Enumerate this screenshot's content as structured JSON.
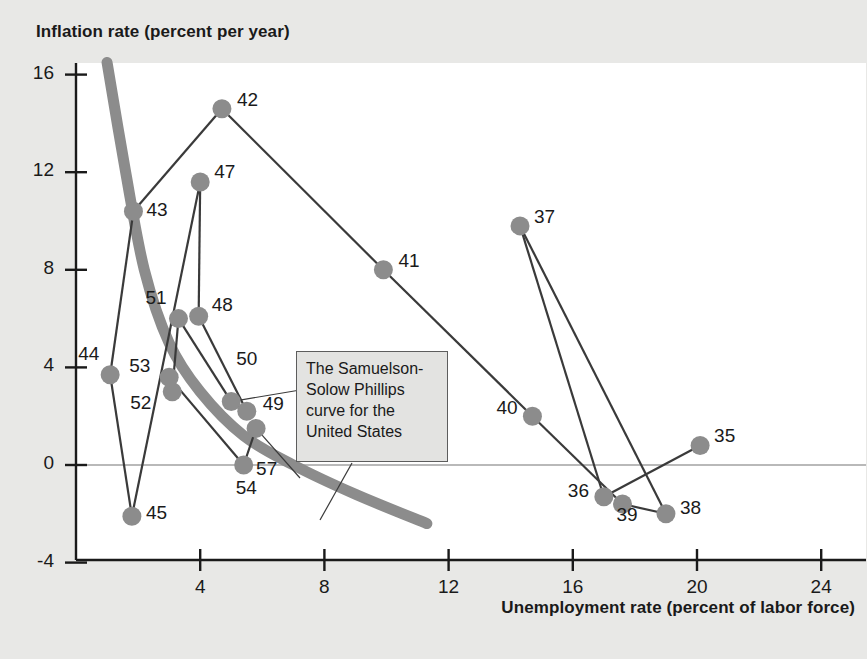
{
  "axes": {
    "y_title": "Inflation rate (percent per year)",
    "x_title": "Unemployment rate (percent of labor force)",
    "y_ticks": [
      "16",
      "12",
      "8",
      "4",
      "0",
      "-4"
    ],
    "x_ticks": [
      "4",
      "8",
      "12",
      "16",
      "20",
      "24"
    ]
  },
  "annotation": {
    "line1": "The Samuelson-",
    "line2": "Solow Phillips",
    "line3": "curve for the",
    "line4": "United States"
  },
  "colors": {
    "marker": "#8c8c8c",
    "curve": "#8c8c8c",
    "connector": "#3a3a3a",
    "plot_bg": "#ffffff",
    "page_bg": "#e8e8e6",
    "text": "#1a1a1a"
  },
  "chart_data": {
    "type": "scatter",
    "title": "",
    "xlabel": "Unemployment rate (percent of labor force)",
    "ylabel": "Inflation rate (percent per year)",
    "xlim": [
      0,
      25.5
    ],
    "ylim": [
      -4,
      17
    ],
    "xticks": [
      4,
      8,
      12,
      16,
      20,
      24
    ],
    "yticks": [
      -4,
      0,
      4,
      8,
      12,
      16
    ],
    "grid": false,
    "legend": null,
    "point_label_note": "Labels are two-digit years (1935-1957)",
    "points": [
      {
        "label": "35",
        "x": 20.1,
        "y": 0.8,
        "lx": 14,
        "ly": -10
      },
      {
        "label": "36",
        "x": 17.0,
        "y": -1.3,
        "lx": -36,
        "ly": -7
      },
      {
        "label": "37",
        "x": 14.3,
        "y": 9.8,
        "lx": 14,
        "ly": -10
      },
      {
        "label": "38",
        "x": 19.0,
        "y": -2.0,
        "lx": 14,
        "ly": -7
      },
      {
        "label": "39",
        "x": 17.6,
        "y": -1.6,
        "lx": -6,
        "ly": 10
      },
      {
        "label": "40",
        "x": 14.7,
        "y": 2.0,
        "lx": -36,
        "ly": -9
      },
      {
        "label": "41",
        "x": 9.9,
        "y": 8.0,
        "lx": 15,
        "ly": -10
      },
      {
        "label": "42",
        "x": 4.7,
        "y": 14.6,
        "lx": 15,
        "ly": -10
      },
      {
        "label": "43",
        "x": 1.85,
        "y": 10.4,
        "lx": 13,
        "ly": -2
      },
      {
        "label": "44",
        "x": 1.1,
        "y": 3.7,
        "lx": -32,
        "ly": -22
      },
      {
        "label": "45",
        "x": 1.8,
        "y": -2.1,
        "lx": 14,
        "ly": -4
      },
      {
        "label": "47",
        "x": 4.0,
        "y": 11.6,
        "lx": 14,
        "ly": -11
      },
      {
        "label": "48",
        "x": 3.95,
        "y": 6.1,
        "lx": 13,
        "ly": -12
      },
      {
        "label": "49",
        "x": 5.5,
        "y": 2.2,
        "lx": 16,
        "ly": -8
      },
      {
        "label": "50",
        "x": 5.0,
        "y": 2.6,
        "lx": 5,
        "ly": -44
      },
      {
        "label": "51",
        "x": 3.3,
        "y": 6.0,
        "lx": -33,
        "ly": -22
      },
      {
        "label": "52",
        "x": 3.1,
        "y": 3.0,
        "lx": -42,
        "ly": 10
      },
      {
        "label": "53",
        "x": 3.0,
        "y": 3.6,
        "lx": -40,
        "ly": -12
      },
      {
        "label": "54",
        "x": 5.4,
        "y": 0.0,
        "lx": -8,
        "ly": 22
      },
      {
        "label": "57",
        "x": 5.8,
        "y": 1.5,
        "lx": 0,
        "ly": 40
      }
    ],
    "path_order": [
      "35",
      "36",
      "37",
      "38",
      "39",
      "40",
      "41",
      "42",
      "43",
      "44",
      "45",
      "47",
      "48",
      "49",
      "50",
      "51",
      "52",
      "53",
      "54",
      "57"
    ],
    "connections": [
      [
        "35",
        "36"
      ],
      [
        "36",
        "37"
      ],
      [
        "37",
        "38"
      ],
      [
        "38",
        "39"
      ],
      [
        "39",
        "40"
      ],
      [
        "40",
        "41"
      ],
      [
        "41",
        "42"
      ],
      [
        "42",
        "43"
      ],
      [
        "43",
        "44"
      ],
      [
        "44",
        "45"
      ],
      [
        "45",
        "47"
      ],
      [
        "47",
        "48"
      ],
      [
        "48",
        "49"
      ],
      [
        "49",
        "50"
      ],
      [
        "50",
        "51"
      ],
      [
        "51",
        "52"
      ],
      [
        "52",
        "53"
      ],
      [
        "53",
        "54"
      ],
      [
        "54",
        "57"
      ]
    ],
    "phillips_curve": {
      "description": "Downward-sloping smooth Samuelson-Solow Phillips curve",
      "points": [
        [
          1.0,
          16.5
        ],
        [
          1.6,
          12.0
        ],
        [
          2.2,
          8.0
        ],
        [
          3.0,
          5.0
        ],
        [
          4.0,
          3.0
        ],
        [
          5.4,
          1.2
        ],
        [
          7.0,
          0.0
        ],
        [
          9.0,
          -1.2
        ],
        [
          11.3,
          -2.4
        ]
      ]
    },
    "zero_line": 0
  }
}
